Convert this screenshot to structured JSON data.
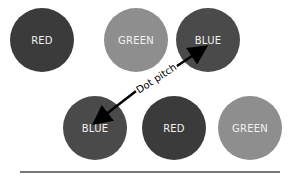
{
  "diagram": {
    "dots": [
      {
        "label": "RED",
        "x": 42,
        "y": 40,
        "shade": "#3b3b3b"
      },
      {
        "label": "GREEN",
        "x": 136,
        "y": 40,
        "shade": "#8e8e8e"
      },
      {
        "label": "BLUE",
        "x": 208,
        "y": 40,
        "shade": "#4a4a4a"
      },
      {
        "label": "BLUE",
        "x": 95,
        "y": 128,
        "shade": "#4a4a4a"
      },
      {
        "label": "RED",
        "x": 174,
        "y": 128,
        "shade": "#3b3b3b"
      },
      {
        "label": "GREEN",
        "x": 250,
        "y": 128,
        "shade": "#8e8e8e"
      }
    ],
    "arrow": {
      "label": "Dot pitch",
      "from": "BLUE (bottom)",
      "to": "BLUE (top)"
    }
  }
}
